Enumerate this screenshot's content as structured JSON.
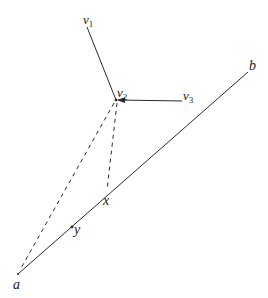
{
  "diagram": {
    "colors": {
      "stroke": "#2a2a2a",
      "background": "#ffffff"
    },
    "points": {
      "v1": {
        "name": "v",
        "sub": "1",
        "x": 87,
        "y": 27
      },
      "v2": {
        "name": "v",
        "sub": "2",
        "x": 116,
        "y": 100
      },
      "v3": {
        "name": "v",
        "sub": "3",
        "x": 182,
        "y": 101
      },
      "a": {
        "name": "a",
        "x": 18,
        "y": 274
      },
      "b": {
        "name": "b",
        "x": 248,
        "y": 72
      },
      "x": {
        "name": "x",
        "x": 107,
        "y": 193
      },
      "y": {
        "name": "y",
        "x": 72,
        "y": 227
      }
    },
    "labels": {
      "v1": "v",
      "v1_sub": "1",
      "v2": "v",
      "v2_sub": "2",
      "v3": "v",
      "v3_sub": "3",
      "a": "a",
      "b": "b",
      "x": "x",
      "y": "y"
    },
    "edges": [
      {
        "from": "v1",
        "to": "v2",
        "style": "solid"
      },
      {
        "from": "v3",
        "to": "v2",
        "style": "solid-arrow"
      },
      {
        "from": "a",
        "to": "b",
        "style": "solid"
      },
      {
        "from": "v2",
        "to": "a",
        "style": "dashed"
      },
      {
        "from": "v2",
        "to": "x",
        "style": "dashed"
      }
    ]
  }
}
